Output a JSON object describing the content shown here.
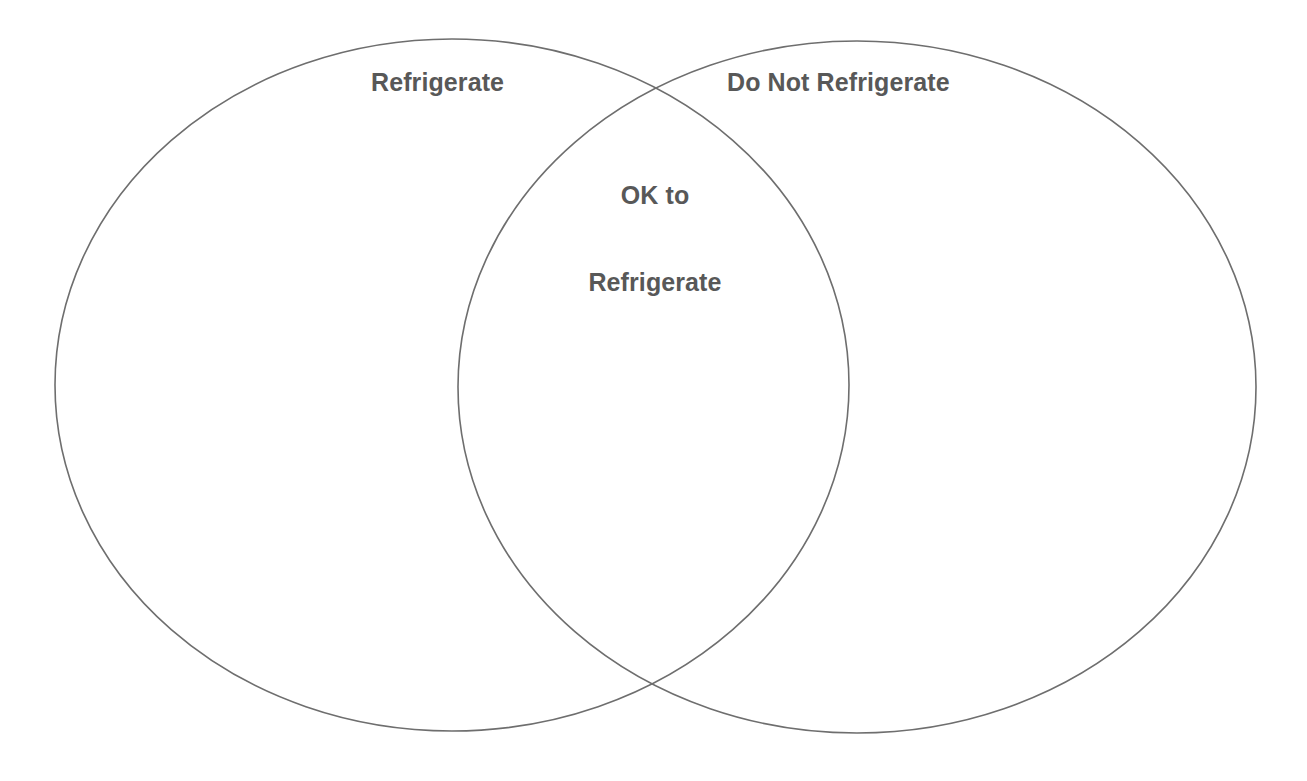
{
  "diagram": {
    "type": "venn",
    "sets": [
      {
        "id": "left",
        "label": "Refrigerate",
        "items": []
      },
      {
        "id": "right",
        "label": "Do Not Refrigerate",
        "items": []
      }
    ],
    "intersection": {
      "id": "intersection",
      "label_line_1": "OK to",
      "label_line_2": "Refrigerate",
      "items": []
    },
    "colors": {
      "stroke": "#6e6e6e",
      "text": "#585858",
      "background": "#ffffff"
    }
  }
}
